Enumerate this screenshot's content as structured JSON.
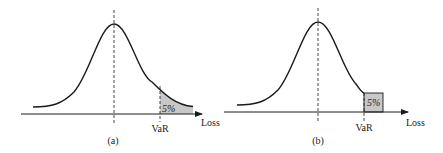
{
  "panels": [
    {
      "id": "a",
      "caption": "(a)",
      "axis_label": "Loss",
      "var_label": "VaR",
      "tail_label": "5%",
      "tail_style": "smooth-tail-shaded"
    },
    {
      "id": "b",
      "caption": "(b)",
      "axis_label": "Loss",
      "var_label": "VaR",
      "tail_label": "5%",
      "tail_style": "discrete-box"
    }
  ],
  "colors": {
    "line": "#1a1a1a",
    "shade": "#c8c8c8",
    "text": "#222222"
  }
}
